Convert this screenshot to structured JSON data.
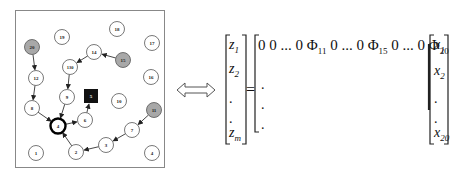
{
  "network": {
    "nodes": [
      {
        "id": "20",
        "x": 32,
        "y": 47,
        "type": "source"
      },
      {
        "id": "19",
        "x": 62,
        "y": 37,
        "type": "normal"
      },
      {
        "id": "18",
        "x": 117,
        "y": 29,
        "type": "normal"
      },
      {
        "id": "17",
        "x": 152,
        "y": 43,
        "type": "normal"
      },
      {
        "id": "14",
        "x": 94,
        "y": 52,
        "type": "normal"
      },
      {
        "id": "15",
        "x": 123,
        "y": 60,
        "type": "source"
      },
      {
        "id": "130",
        "x": 70,
        "y": 67,
        "type": "normal"
      },
      {
        "id": "12",
        "x": 36,
        "y": 78,
        "type": "normal"
      },
      {
        "id": "16",
        "x": 151,
        "y": 77,
        "type": "normal"
      },
      {
        "id": "9",
        "x": 67,
        "y": 97,
        "type": "normal"
      },
      {
        "id": "5",
        "x": 91,
        "y": 96,
        "type": "sink-square"
      },
      {
        "id": "10",
        "x": 119,
        "y": 101,
        "type": "normal"
      },
      {
        "id": "8",
        "x": 32,
        "y": 108,
        "type": "normal"
      },
      {
        "id": "11",
        "x": 154,
        "y": 110,
        "type": "source"
      },
      {
        "id": "6",
        "x": 85,
        "y": 120,
        "type": "normal"
      },
      {
        "id": "4",
        "x": 58,
        "y": 126,
        "type": "bold"
      },
      {
        "id": "7",
        "x": 132,
        "y": 130,
        "type": "normal"
      },
      {
        "id": "3",
        "x": 106,
        "y": 145,
        "type": "normal"
      },
      {
        "id": "1",
        "x": 36,
        "y": 153,
        "type": "normal"
      },
      {
        "id": "2",
        "x": 76,
        "y": 152,
        "type": "normal"
      },
      {
        "id": "4",
        "x": 152,
        "y": 153,
        "type": "normal"
      }
    ],
    "edges": [
      {
        "from": [
          32,
          47
        ],
        "to": [
          36,
          78
        ]
      },
      {
        "from": [
          36,
          78
        ],
        "to": [
          32,
          108
        ]
      },
      {
        "from": [
          32,
          108
        ],
        "to": [
          58,
          126
        ]
      },
      {
        "from": [
          123,
          60
        ],
        "to": [
          94,
          52
        ]
      },
      {
        "from": [
          94,
          52
        ],
        "to": [
          70,
          67
        ]
      },
      {
        "from": [
          70,
          67
        ],
        "to": [
          67,
          97
        ]
      },
      {
        "from": [
          67,
          97
        ],
        "to": [
          58,
          126
        ]
      },
      {
        "from": [
          58,
          126
        ],
        "to": [
          85,
          120
        ]
      },
      {
        "from": [
          85,
          120
        ],
        "to": [
          91,
          96
        ]
      },
      {
        "from": [
          154,
          110
        ],
        "to": [
          132,
          130
        ]
      },
      {
        "from": [
          132,
          130
        ],
        "to": [
          106,
          145
        ]
      },
      {
        "from": [
          106,
          145
        ],
        "to": [
          76,
          152
        ]
      },
      {
        "from": [
          76,
          152
        ],
        "to": [
          58,
          126
        ]
      }
    ]
  },
  "equivalence_symbol": "⇔",
  "equation": {
    "lhs": [
      "Z1",
      "Z2",
      ".",
      ".",
      "Zm"
    ],
    "lhs_items": [
      {
        "base": "z",
        "sub": "1"
      },
      {
        "base": "z",
        "sub": "2"
      },
      {
        "base": ".",
        "sub": ""
      },
      {
        "base": ".",
        "sub": ""
      },
      {
        "base": "z",
        "sub": "m"
      }
    ],
    "equals": "=",
    "matrix_row": {
      "prefix": "0 0 ... 0 ",
      "phi1_base": "Φ",
      "phi1_sub": "11",
      "mid1": " 0 ... 0 ",
      "phi2_base": "Φ",
      "phi2_sub": "15",
      "mid2": " 0 ... 0 ",
      "phi3_base": "Φ",
      "phi3_sub": "20"
    },
    "matrix_dots": [
      ".",
      ".",
      "."
    ],
    "rhs_items": [
      {
        "base": "x",
        "sub": "1"
      },
      {
        "base": "x",
        "sub": "2"
      },
      {
        "base": ".",
        "sub": ""
      },
      {
        "base": ".",
        "sub": ""
      },
      {
        "base": "x",
        "sub": "20"
      }
    ]
  },
  "colors": {
    "source_fill": "#a8a8a8",
    "node_fill": "#ffffff",
    "sink_fill": "#111111",
    "stroke": "#333333"
  }
}
